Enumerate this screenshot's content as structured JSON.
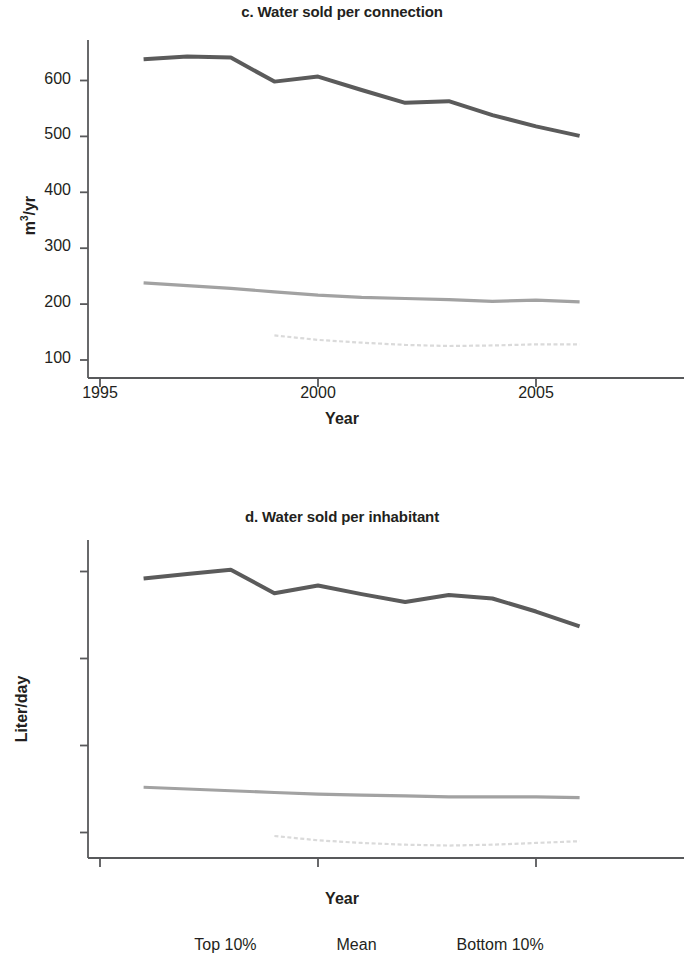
{
  "figure": {
    "legend": {
      "items": [
        {
          "label": "Top 10%",
          "color": "#595959",
          "width": 4,
          "style": "solid",
          "name": "top-10"
        },
        {
          "label": "Mean",
          "color": "#9d9d9d",
          "width": 3,
          "style": "solid",
          "name": "mean"
        },
        {
          "label": "Bottom 10%",
          "color": "#d8d8d8",
          "width": 2,
          "style": "dotted",
          "name": "bottom-10"
        }
      ]
    }
  },
  "panels": {
    "c": {
      "title": "c. Water sold per connection",
      "ylabel_main": "m",
      "ylabel_sup": "3",
      "ylabel_rest": "/yr",
      "xlabel": "Year",
      "ytick_labels": [
        "600",
        "500",
        "400",
        "300",
        "200",
        "100"
      ],
      "xtick_labels": [
        "1995",
        "2000",
        "2005"
      ]
    },
    "d": {
      "title": "d. Water sold per inhabitant",
      "ylabel": "Liter/day",
      "xlabel": "Year",
      "ytick_labels": [
        "400",
        "300",
        "200",
        "100"
      ],
      "xtick_labels": [
        "1995",
        "2000",
        "2005"
      ]
    }
  },
  "chart_data": [
    {
      "id": "c",
      "type": "line",
      "title": "c. Water sold per connection",
      "xlabel": "Year",
      "ylabel": "m3/yr",
      "x": [
        1996,
        1997,
        1998,
        1999,
        2000,
        2001,
        2002,
        2003,
        2004,
        2005,
        2006
      ],
      "xlim": [
        1995,
        2006.2
      ],
      "ylim": [
        75,
        660
      ],
      "xticks": [
        1995,
        2000,
        2005
      ],
      "yticks": [
        100,
        200,
        300,
        400,
        500,
        600
      ],
      "grid": false,
      "legend_position": "bottom-center-shared",
      "series": [
        {
          "name": "Top 10%",
          "color": "#595959",
          "x": [
            1996,
            1997,
            1998,
            1999,
            2000,
            2001,
            2002,
            2003,
            2004,
            2005,
            2006
          ],
          "values": [
            638,
            643,
            641,
            598,
            607,
            583,
            560,
            563,
            538,
            518,
            501
          ]
        },
        {
          "name": "Mean",
          "color": "#9d9d9d",
          "x": [
            1996,
            1997,
            1998,
            1999,
            2000,
            2001,
            2002,
            2003,
            2004,
            2005,
            2006
          ],
          "values": [
            238,
            233,
            228,
            222,
            216,
            212,
            210,
            208,
            205,
            207,
            204
          ]
        },
        {
          "name": "Bottom 10%",
          "color": "#d8d8d8",
          "x": [
            1999,
            2000,
            2001,
            2002,
            2003,
            2004,
            2005,
            2006
          ],
          "values": [
            144,
            136,
            131,
            127,
            125,
            126,
            128,
            128
          ]
        }
      ]
    },
    {
      "id": "d",
      "type": "line",
      "title": "d. Water sold per inhabitant",
      "xlabel": "Year",
      "ylabel": "Liter/day",
      "x": [
        1996,
        1997,
        1998,
        1999,
        2000,
        2001,
        2002,
        2003,
        2004,
        2005,
        2006
      ],
      "xlim": [
        1995,
        2006.2
      ],
      "ylim": [
        60,
        420
      ],
      "xticks": [
        1995,
        2000,
        2005
      ],
      "yticks": [
        100,
        200,
        300,
        400
      ],
      "grid": false,
      "legend_position": "bottom-center-shared",
      "series": [
        {
          "name": "Top 10%",
          "color": "#595959",
          "x": [
            1996,
            1997,
            1998,
            1999,
            2000,
            2001,
            2002,
            2003,
            2004,
            2005,
            2006
          ],
          "values": [
            392,
            397,
            402,
            375,
            384,
            374,
            365,
            373,
            369,
            354,
            337
          ]
        },
        {
          "name": "Mean",
          "color": "#9d9d9d",
          "x": [
            1996,
            1997,
            1998,
            1999,
            2000,
            2001,
            2002,
            2003,
            2004,
            2005,
            2006
          ],
          "values": [
            152,
            150,
            148,
            146,
            144,
            143,
            142,
            141,
            141,
            141,
            140
          ]
        },
        {
          "name": "Bottom 10%",
          "color": "#d8d8d8",
          "x": [
            1999,
            2000,
            2001,
            2002,
            2003,
            2004,
            2005,
            2006
          ],
          "values": [
            96,
            91,
            88,
            86,
            85,
            86,
            88,
            90
          ]
        }
      ]
    }
  ]
}
